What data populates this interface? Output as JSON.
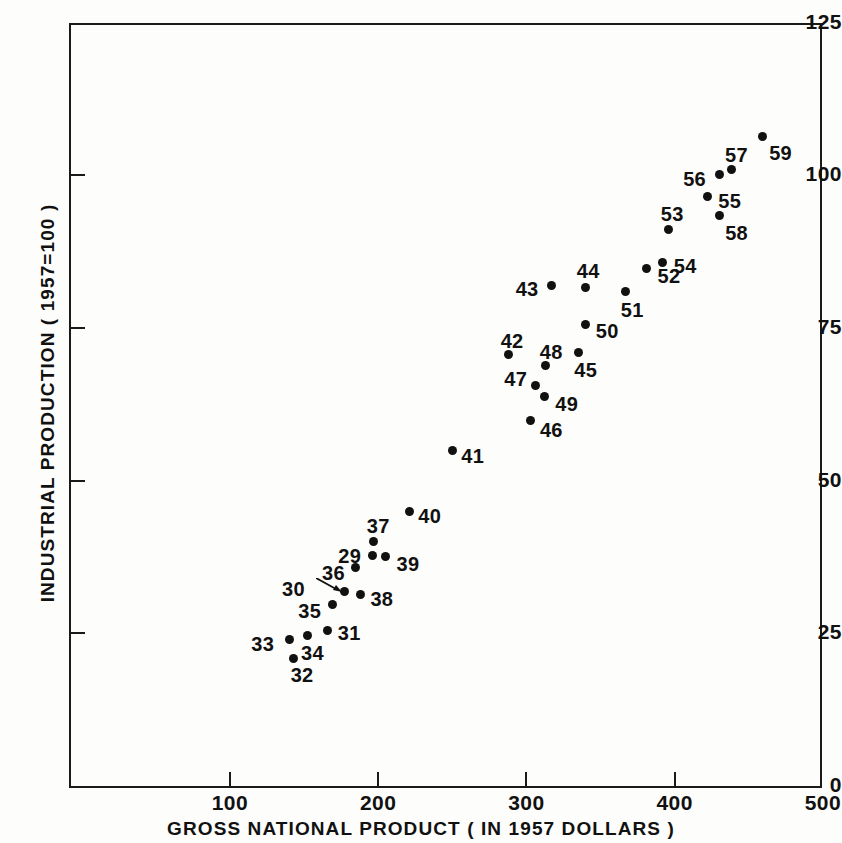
{
  "chart_data": {
    "type": "scatter",
    "title": "",
    "xlabel": "GROSS NATIONAL PRODUCT ( IN 1957 DOLLARS )",
    "ylabel": "INDUSTRIAL PRODUCTION ( 1957=100 )",
    "xlim": [
      0,
      500
    ],
    "ylim": [
      0,
      125
    ],
    "xticks": [
      100,
      200,
      300,
      400,
      500
    ],
    "yticks": [
      0,
      25,
      50,
      75,
      100,
      125
    ],
    "grid": false,
    "legend": null,
    "point_label_key": "year (two-digit)",
    "points": [
      {
        "label": "29",
        "x": 196,
        "y": 37.7
      },
      {
        "label": "30",
        "x": 177,
        "y": 31.9
      },
      {
        "label": "31",
        "x": 166,
        "y": 25.4
      },
      {
        "label": "32",
        "x": 143,
        "y": 20.8
      },
      {
        "label": "33",
        "x": 140,
        "y": 24.0
      },
      {
        "label": "34",
        "x": 152,
        "y": 24.6
      },
      {
        "label": "35",
        "x": 169,
        "y": 29.8
      },
      {
        "label": "36",
        "x": 185,
        "y": 35.7
      },
      {
        "label": "37",
        "x": 197,
        "y": 40.0
      },
      {
        "label": "38",
        "x": 188,
        "y": 31.4
      },
      {
        "label": "39",
        "x": 205,
        "y": 37.5
      },
      {
        "label": "40",
        "x": 221,
        "y": 45.0
      },
      {
        "label": "41",
        "x": 250,
        "y": 54.9
      },
      {
        "label": "42",
        "x": 288,
        "y": 70.6
      },
      {
        "label": "43",
        "x": 317,
        "y": 81.9
      },
      {
        "label": "44",
        "x": 340,
        "y": 81.6
      },
      {
        "label": "45",
        "x": 335,
        "y": 71.0
      },
      {
        "label": "46",
        "x": 303,
        "y": 59.8
      },
      {
        "label": "47",
        "x": 306,
        "y": 65.5
      },
      {
        "label": "48",
        "x": 313,
        "y": 68.9
      },
      {
        "label": "49",
        "x": 312,
        "y": 63.7
      },
      {
        "label": "50",
        "x": 340,
        "y": 75.6
      },
      {
        "label": "51",
        "x": 367,
        "y": 80.9
      },
      {
        "label": "52",
        "x": 381,
        "y": 84.8
      },
      {
        "label": "53",
        "x": 396,
        "y": 91.2
      },
      {
        "label": "54",
        "x": 392,
        "y": 85.8
      },
      {
        "label": "55",
        "x": 422,
        "y": 96.6
      },
      {
        "label": "56",
        "x": 430,
        "y": 100.1
      },
      {
        "label": "57",
        "x": 438,
        "y": 100.9
      },
      {
        "label": "58",
        "x": 430,
        "y": 93.4
      },
      {
        "label": "59",
        "x": 459,
        "y": 106.3
      }
    ]
  },
  "axes": {
    "y_labels": [
      "125",
      "100",
      "75",
      "50",
      "25",
      "0"
    ],
    "x_labels": [
      "100",
      "200",
      "300",
      "400",
      "500"
    ],
    "x_title": "GROSS NATIONAL PRODUCT ( IN 1957 DOLLARS )",
    "y_title": "INDUSTRIAL PRODUCTION ( 1957=100 )"
  }
}
